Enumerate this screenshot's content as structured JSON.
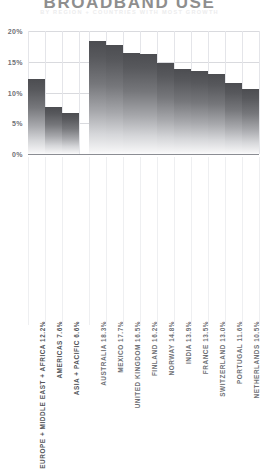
{
  "header": {
    "title": "BROADBAND USE",
    "subtitle": "BY REGION + COUNTRIES WITH MOST GROWTH"
  },
  "axis": {
    "y_ticks": [
      "0%",
      "5%",
      "10%",
      "15%",
      "20%"
    ]
  },
  "chart_data": {
    "type": "bar",
    "title": "BROADBAND USE",
    "subtitle": "BY REGION + COUNTRIES WITH MOST GROWTH",
    "xlabel": "",
    "ylabel": "",
    "ylim": [
      0,
      20
    ],
    "ytick_values": [
      0,
      5,
      10,
      15,
      20
    ],
    "ytick_labels": [
      "0%",
      "5%",
      "10%",
      "15%",
      "20%"
    ],
    "grid": true,
    "legend": "none",
    "groups": [
      {
        "name": "BY REGION",
        "categories": [
          "EUROPE + MIDDLE EAST + AFRICA",
          "AMERICAS",
          "ASIA + PACIFIC"
        ],
        "values": [
          12.2,
          7.6,
          6.6
        ]
      },
      {
        "name": "COUNTRIES WITH MOST GROWTH",
        "categories": [
          "AUSTRALIA",
          "MEXICO",
          "UNITED KINGDOM",
          "FINLAND",
          "NORWAY",
          "INDIA",
          "FRANCE",
          "SWITZERLAND",
          "PORTUGAL",
          "NETHERLANDS"
        ],
        "values": [
          18.3,
          17.7,
          16.5,
          16.2,
          14.8,
          13.9,
          13.5,
          13.0,
          11.6,
          10.5
        ]
      }
    ],
    "categories": [
      "EUROPE + MIDDLE EAST + AFRICA",
      "AMERICAS",
      "ASIA + PACIFIC",
      "AUSTRALIA",
      "MEXICO",
      "UNITED KINGDOM",
      "FINLAND",
      "NORWAY",
      "INDIA",
      "FRANCE",
      "SWITZERLAND",
      "PORTUGAL",
      "NETHERLANDS"
    ],
    "values": [
      12.2,
      7.6,
      6.6,
      18.3,
      17.7,
      16.5,
      16.2,
      14.8,
      13.9,
      13.5,
      13.0,
      11.6,
      10.5
    ]
  },
  "bars": [
    {
      "label": "EUROPE + MIDDLE EAST + AFRICA 12.2%",
      "name": "EUROPE + MIDDLE EAST + AFRICA",
      "value": 12.2,
      "value_label": "12.2%",
      "group": "region"
    },
    {
      "label": "AMERICAS 7.6%",
      "name": "AMERICAS",
      "value": 7.6,
      "value_label": "7.6%",
      "group": "region"
    },
    {
      "label": "ASIA + PACIFIC 6.6%",
      "name": "ASIA + PACIFIC",
      "value": 6.6,
      "value_label": "6.6%",
      "group": "region"
    },
    {
      "label": "AUSTRALIA 18.3%",
      "name": "AUSTRALIA",
      "value": 18.3,
      "value_label": "18.3%",
      "group": "country"
    },
    {
      "label": "MEXICO 17.7%",
      "name": "MEXICO",
      "value": 17.7,
      "value_label": "17.7%",
      "group": "country"
    },
    {
      "label": "UNITED KINGDOM 16.5%",
      "name": "UNITED KINGDOM",
      "value": 16.5,
      "value_label": "16.5%",
      "group": "country"
    },
    {
      "label": "FINLAND 16.2%",
      "name": "FINLAND",
      "value": 16.2,
      "value_label": "16.2%",
      "group": "country"
    },
    {
      "label": "NORWAY 14.8%",
      "name": "NORWAY",
      "value": 14.8,
      "value_label": "14.8%",
      "group": "country"
    },
    {
      "label": "INDIA 13.9%",
      "name": "INDIA",
      "value": 13.9,
      "value_label": "13.9%",
      "group": "country"
    },
    {
      "label": "FRANCE 13.5%",
      "name": "FRANCE",
      "value": 13.5,
      "value_label": "13.5%",
      "group": "country"
    },
    {
      "label": "SWITZERLAND 13.0%",
      "name": "SWITZERLAND",
      "value": 13.0,
      "value_label": "13.0%",
      "group": "country"
    },
    {
      "label": "PORTUGAL 11.6%",
      "name": "PORTUGAL",
      "value": 11.6,
      "value_label": "11.6%",
      "group": "country"
    },
    {
      "label": "NETHERLANDS 10.5%",
      "name": "NETHERLANDS",
      "value": 10.5,
      "value_label": "10.5%",
      "group": "country"
    }
  ],
  "colors": {
    "bar_top": "#4c4d51",
    "bar_bottom": "#fbfbfc",
    "grid": "#e4e5e9",
    "axis": "#8b8d93",
    "title": "#8e8e8e",
    "subtitle": "#ececed",
    "label": "#6f7176"
  }
}
